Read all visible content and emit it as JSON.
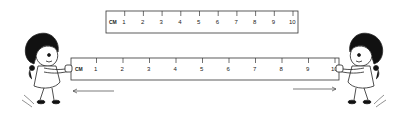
{
  "figure": {
    "top_ruler": {
      "unit_label": "CM",
      "ticks": [
        "1",
        "2",
        "3",
        "4",
        "5",
        "6",
        "7",
        "8",
        "9",
        "10"
      ]
    },
    "stretched_ruler": {
      "unit_label": "CM",
      "ticks": [
        "1",
        "2",
        "3",
        "4",
        "5",
        "6",
        "7",
        "8",
        "9",
        "10"
      ]
    },
    "arrows": [
      {
        "direction": "left"
      },
      {
        "direction": "right"
      }
    ],
    "figures": [
      {
        "name": "girl-left",
        "pulling": "left"
      },
      {
        "name": "girl-right",
        "pulling": "right"
      }
    ],
    "colors": {
      "ink": "#222222",
      "background": "#ffffff"
    }
  }
}
